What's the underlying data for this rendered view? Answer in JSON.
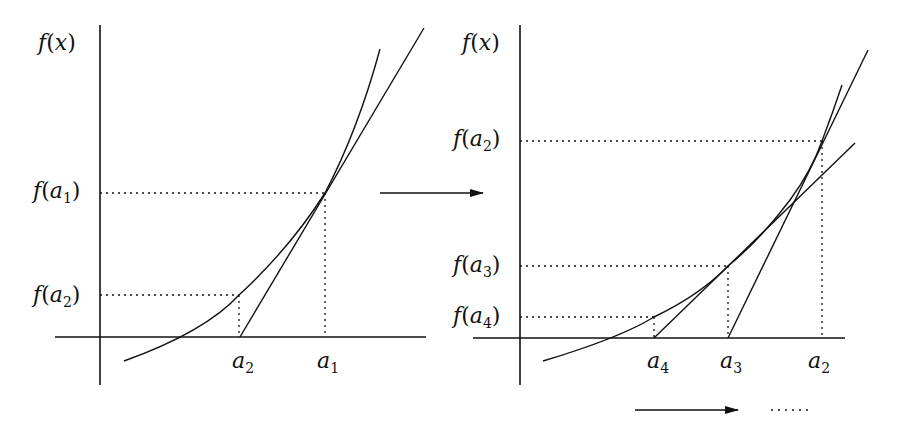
{
  "diagram": {
    "colors": {
      "stroke": "#111111",
      "background": "#ffffff"
    },
    "left_panel": {
      "y_axis_label": {
        "fn": "f",
        "arg": "x"
      },
      "y_labels": [
        {
          "fn": "f",
          "var": "a",
          "sub": "1"
        },
        {
          "fn": "f",
          "var": "a",
          "sub": "2"
        }
      ],
      "x_labels": [
        {
          "var": "a",
          "sub": "2"
        },
        {
          "var": "a",
          "sub": "1"
        }
      ]
    },
    "right_panel": {
      "y_axis_label": {
        "fn": "f",
        "arg": "x"
      },
      "y_labels": [
        {
          "fn": "f",
          "var": "a",
          "sub": "2"
        },
        {
          "fn": "f",
          "var": "a",
          "sub": "3"
        },
        {
          "fn": "f",
          "var": "a",
          "sub": "4"
        }
      ],
      "x_labels": [
        {
          "var": "a",
          "sub": "4"
        },
        {
          "var": "a",
          "sub": "3"
        },
        {
          "var": "a",
          "sub": "2"
        }
      ]
    },
    "arrows": [
      {
        "name": "panel-transition-arrow"
      },
      {
        "name": "convergence-arrow",
        "continues": "dotted"
      }
    ]
  }
}
